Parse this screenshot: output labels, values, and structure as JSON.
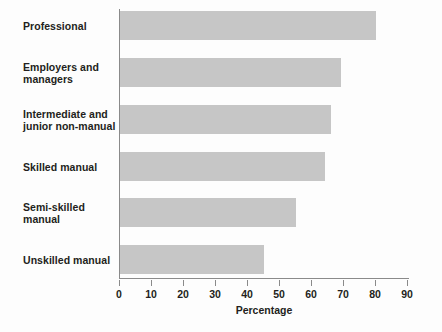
{
  "chart_data": {
    "type": "bar",
    "orientation": "horizontal",
    "title": "",
    "subtitle": "",
    "xlabel": "Percentage",
    "ylabel": "",
    "categories": [
      "Professional",
      "Employers and managers",
      "Intermediate and junior non-manual",
      "Skilled manual",
      "Semi-skilled manual",
      "Unskilled manual"
    ],
    "values": [
      80,
      69,
      66,
      64,
      55,
      45
    ],
    "xlim": [
      0,
      90
    ],
    "xticks": [
      0,
      10,
      20,
      30,
      40,
      50,
      60,
      70,
      80,
      90
    ],
    "xtick_labels": [
      "0",
      "10",
      "20",
      "30",
      "40",
      "50",
      "60",
      "70",
      "80",
      "90"
    ],
    "grid": false,
    "legend": null,
    "legend_position": "none",
    "bar_color": "#c6c6c6",
    "axis_color": "#8a8a8a",
    "text_color": "#231f20",
    "background_color": "#fdfdfd"
  },
  "labels": {
    "cat_0": "Professional",
    "cat_1_line1": "Employers and",
    "cat_1_line2": "managers",
    "cat_2_line1": "Intermediate and",
    "cat_2_line2": "junior non-manual",
    "cat_3": "Skilled manual",
    "cat_4_line1": "Semi-skilled",
    "cat_4_line2": "manual",
    "cat_5": "Unskilled manual"
  }
}
